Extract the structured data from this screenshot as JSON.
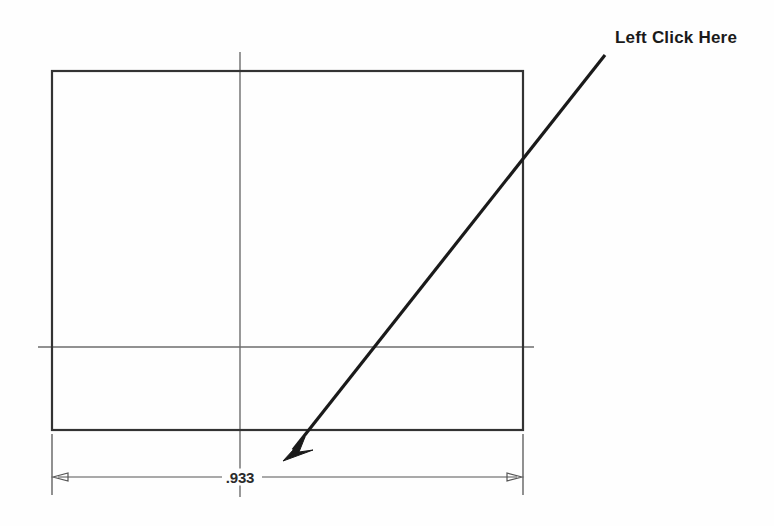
{
  "drawing": {
    "title": "Rectangular part outline with width dimension",
    "background_color": "#fefefe",
    "outline_color": "#333333",
    "centerline_color": "#6d6d6d",
    "dimension_color": "#555555",
    "annotation_color": "#1a1a1a",
    "part": {
      "name": "rectangle-outline",
      "left": 52,
      "top": 71,
      "right": 523,
      "bottom": 430
    },
    "centerlines": {
      "vertical": {
        "x": 240,
        "y1": 52,
        "y2": 497
      },
      "horizontal": {
        "y": 347,
        "x1": 38,
        "x2": 534
      }
    },
    "dimension": {
      "name": "width-dimension",
      "value": ".933",
      "line_y": 477,
      "x1": 52,
      "x2": 523,
      "arrow_direction": "outward",
      "extension_line_bottom": 495
    },
    "annotation": {
      "label": "Left Click Here",
      "leader": {
        "start_x": 605,
        "start_y": 55,
        "tip_x": 285,
        "tip_y": 458
      }
    }
  }
}
